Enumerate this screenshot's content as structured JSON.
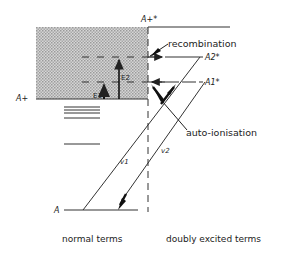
{
  "diagram": {
    "labels": {
      "ion_excited": "A+*",
      "ion": "A+",
      "atom": "A",
      "level_a2": "A2*",
      "level_a1": "A1*",
      "e1": "E1",
      "e2": "E2",
      "v1": "v1",
      "v2": "v2",
      "recombination": "recombination",
      "auto_ionisation": "auto-ionisation",
      "normal_terms": "normal terms",
      "doubly_excited_terms": "doubly excited terms"
    },
    "colors": {
      "ink": "#222222",
      "shading": "#bdbdbd"
    }
  }
}
